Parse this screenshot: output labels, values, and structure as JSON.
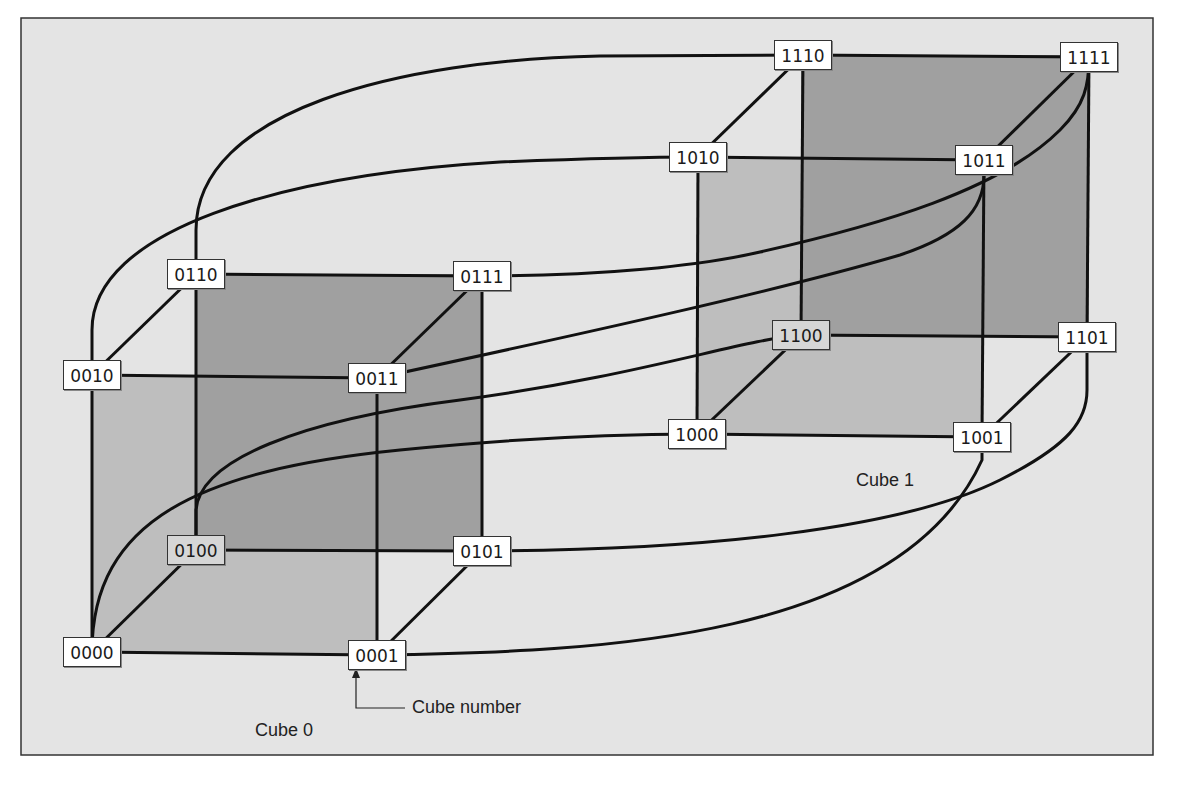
{
  "figure": {
    "type": "4-dimensional hypercube (two 3-cubes connected)",
    "colors": {
      "page_background": "#ffffff",
      "panel_background": "#e4e4e4",
      "panel_border": "#333333",
      "back_face": "#a0a0a0",
      "side_face": "#bebebe",
      "edge": "#111111"
    },
    "labels": {
      "cube0": "Cube 0",
      "cube1": "Cube 1",
      "cube_number": "Cube number"
    }
  },
  "nodes": [
    {
      "id": "0000",
      "label": "0000",
      "x": 92,
      "y": 652,
      "shade": "front"
    },
    {
      "id": "0001",
      "label": "0001",
      "x": 377,
      "y": 655,
      "shade": "front"
    },
    {
      "id": "0010",
      "label": "0010",
      "x": 92,
      "y": 375,
      "shade": "front"
    },
    {
      "id": "0011",
      "label": "0011",
      "x": 377,
      "y": 378,
      "shade": "front"
    },
    {
      "id": "0100",
      "label": "0100",
      "x": 196,
      "y": 550,
      "shade": "back"
    },
    {
      "id": "0101",
      "label": "0101",
      "x": 482,
      "y": 551,
      "shade": "front"
    },
    {
      "id": "0110",
      "label": "0110",
      "x": 196,
      "y": 274,
      "shade": "front"
    },
    {
      "id": "0111",
      "label": "0111",
      "x": 482,
      "y": 276,
      "shade": "front"
    },
    {
      "id": "1000",
      "label": "1000",
      "x": 697,
      "y": 434,
      "shade": "front"
    },
    {
      "id": "1001",
      "label": "1001",
      "x": 982,
      "y": 437,
      "shade": "front"
    },
    {
      "id": "1010",
      "label": "1010",
      "x": 698,
      "y": 157,
      "shade": "front"
    },
    {
      "id": "1011",
      "label": "1011",
      "x": 984,
      "y": 160,
      "shade": "front"
    },
    {
      "id": "1100",
      "label": "1100",
      "x": 801,
      "y": 335,
      "shade": "back"
    },
    {
      "id": "1101",
      "label": "1101",
      "x": 1087,
      "y": 337,
      "shade": "front"
    },
    {
      "id": "1110",
      "label": "1110",
      "x": 803,
      "y": 55,
      "shade": "front"
    },
    {
      "id": "1111",
      "label": "1111",
      "x": 1089,
      "y": 57,
      "shade": "front"
    }
  ],
  "edges_cube": [
    [
      "0000",
      "0001"
    ],
    [
      "0000",
      "0010"
    ],
    [
      "0000",
      "0100"
    ],
    [
      "0001",
      "0011"
    ],
    [
      "0001",
      "0101"
    ],
    [
      "0010",
      "0011"
    ],
    [
      "0010",
      "0110"
    ],
    [
      "0011",
      "0111"
    ],
    [
      "0100",
      "0101"
    ],
    [
      "0100",
      "0110"
    ],
    [
      "0101",
      "0111"
    ],
    [
      "0110",
      "0111"
    ],
    [
      "1000",
      "1001"
    ],
    [
      "1000",
      "1010"
    ],
    [
      "1000",
      "1100"
    ],
    [
      "1001",
      "1011"
    ],
    [
      "1001",
      "1101"
    ],
    [
      "1010",
      "1011"
    ],
    [
      "1010",
      "1110"
    ],
    [
      "1011",
      "1111"
    ],
    [
      "1100",
      "1101"
    ],
    [
      "1100",
      "1110"
    ],
    [
      "1101",
      "1111"
    ],
    [
      "1110",
      "1111"
    ]
  ],
  "edges_link": [
    {
      "from": "0000",
      "to": "1000",
      "path": "M92,652 C92,520 200,470 400,450 C520,438 620,434 697,434"
    },
    {
      "from": "0001",
      "to": "1001",
      "path": "M377,655 C600,652 900,640 982,460 L982,437"
    },
    {
      "from": "0010",
      "to": "1010",
      "path": "M92,375 L92,330 C92,230 280,175 500,162 C600,158 650,157 698,157"
    },
    {
      "from": "0011",
      "to": "1011",
      "path": "M377,378 C600,330 780,290 900,255 C960,235 984,210 984,175 L984,160"
    },
    {
      "from": "0100",
      "to": "1100",
      "path": "M196,550 L196,510 C200,460 300,420 460,400 C640,376 740,340 801,335"
    },
    {
      "from": "0101",
      "to": "1101",
      "path": "M482,551 C700,550 900,530 1000,480 C1070,445 1087,420 1087,390 L1087,337"
    },
    {
      "from": "0110",
      "to": "1110",
      "path": "M196,274 L196,230 C196,110 400,60 600,56 C700,55 760,55 803,55"
    },
    {
      "from": "0111",
      "to": "1111",
      "path": "M482,276 C600,276 700,266 760,252 C880,225 1000,190 1060,130 C1085,105 1089,85 1089,57"
    }
  ],
  "annotations": {
    "arrow": {
      "x": 356,
      "y_tip": 668,
      "y_bottom": 708,
      "x_end": 405
    },
    "cube_number_pos": {
      "x": 412,
      "y": 698
    },
    "cube0_pos": {
      "x": 255,
      "y": 720
    },
    "cube1_pos": {
      "x": 856,
      "y": 470
    }
  }
}
